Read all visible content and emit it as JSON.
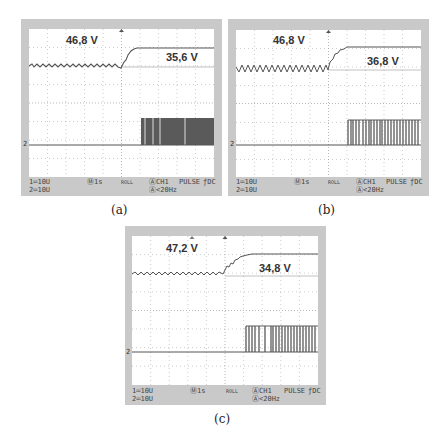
{
  "figures": [
    {
      "id": "a",
      "caption": "(a)",
      "labels": {
        "upper": "46,8 V",
        "lower": "35,6 V"
      },
      "channel_marker": "2",
      "status": {
        "ch1_scale": "1═10U",
        "ch2_scale": "2═10U",
        "timebase": "Ⓜ1s",
        "mode": "ROLL",
        "trigger_src": "ⒶCH1",
        "trigger_type": "PULSE",
        "coupling": "ƒDC",
        "trigger_cond": "Ⓐ<20Hz"
      }
    },
    {
      "id": "b",
      "caption": "(b)",
      "labels": {
        "upper": "46,8 V",
        "lower": "36,8 V"
      },
      "channel_marker": "2",
      "status": {
        "ch1_scale": "1═10U",
        "ch2_scale": "2═10U",
        "timebase": "Ⓜ1s",
        "mode": "ROLL",
        "trigger_src": "ⒶCH1",
        "trigger_type": "PULSE",
        "coupling": "ƒDC",
        "trigger_cond": "Ⓐ<20Hz"
      }
    },
    {
      "id": "c",
      "caption": "(c)",
      "labels": {
        "upper": "47,2 V",
        "lower": "34,8 V"
      },
      "channel_marker": "2",
      "status": {
        "ch1_scale": "1═10U",
        "ch2_scale": "2═10U",
        "timebase": "Ⓜ1s",
        "mode": "ROLL",
        "trigger_src": "ⒶCH1",
        "trigger_type": "PULSE",
        "coupling": "ƒDC",
        "trigger_cond": "Ⓐ<20Hz"
      }
    }
  ],
  "colors": {
    "frame": "#c9c9c9",
    "trace": "#555555",
    "grid": "#aaaaaa",
    "pulse": "#5a5a5a"
  }
}
